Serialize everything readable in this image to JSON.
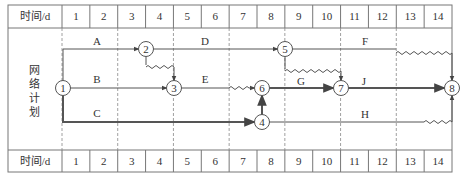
{
  "header_row": {
    "label": "时间/d",
    "days": [
      "1",
      "2",
      "3",
      "4",
      "5",
      "6",
      "7",
      "8",
      "9",
      "10",
      "11",
      "12",
      "13",
      "14"
    ]
  },
  "footer_row": {
    "label": "时间/d",
    "days": [
      "1",
      "2",
      "3",
      "4",
      "5",
      "6",
      "7",
      "8",
      "9",
      "10",
      "11",
      "12",
      "13",
      "14"
    ]
  },
  "side_label": [
    "网",
    "络",
    "计",
    "划"
  ],
  "nodes": [
    {
      "id": "1",
      "label": "1"
    },
    {
      "id": "2",
      "label": "2"
    },
    {
      "id": "3",
      "label": "3"
    },
    {
      "id": "4",
      "label": "4"
    },
    {
      "id": "5",
      "label": "5"
    },
    {
      "id": "6",
      "label": "6"
    },
    {
      "id": "7",
      "label": "7"
    },
    {
      "id": "8",
      "label": "8"
    }
  ],
  "activities": [
    {
      "name": "A",
      "from": "1",
      "to": "2",
      "critical": false
    },
    {
      "name": "B",
      "from": "1",
      "to": "3",
      "critical": false
    },
    {
      "name": "C",
      "from": "1",
      "to": "4",
      "critical": true
    },
    {
      "name": "D",
      "from": "2",
      "to": "5",
      "critical": false
    },
    {
      "name": "E",
      "from": "3",
      "to": "6",
      "critical": false
    },
    {
      "name": "F",
      "from": "5",
      "to": "8",
      "critical": false
    },
    {
      "name": "G",
      "from": "6",
      "to": "7",
      "critical": true
    },
    {
      "name": "H",
      "from": "4",
      "to": "8",
      "critical": false
    },
    {
      "name": "J",
      "from": "7",
      "to": "8",
      "critical": true
    }
  ],
  "colors": {
    "line": "#555555",
    "critical_line": "#444444",
    "grid": "#777777",
    "dashed": "#888888"
  }
}
